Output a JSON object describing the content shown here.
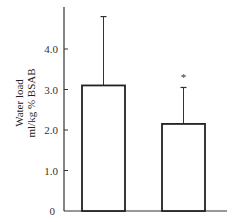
{
  "chart_data": {
    "type": "bar",
    "title": "",
    "xlabel": "",
    "ylabel": [
      "Water load",
      "ml/kg % BSAB"
    ],
    "ylim": [
      0,
      5
    ],
    "yticks": [
      0,
      1.0,
      2.0,
      3.0,
      4.0
    ],
    "ytick_labels": [
      "0",
      "1.0",
      "2.0",
      "3.0",
      "4.0"
    ],
    "categories": [
      "Group 1",
      "Group 2"
    ],
    "show_category_labels": false,
    "values": [
      3.1,
      2.15
    ],
    "error_upper": [
      1.7,
      0.9
    ],
    "annotations": [
      {
        "category_index": 1,
        "text": "*"
      }
    ],
    "grid": false,
    "bar_fill": "#ffffff",
    "bar_stroke": "#222222",
    "legend": null
  }
}
